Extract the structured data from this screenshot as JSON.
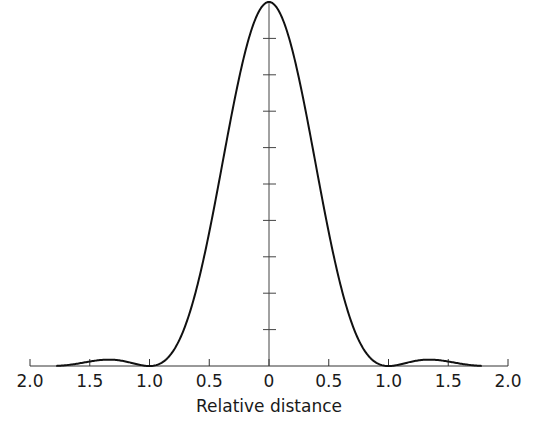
{
  "chart_data": {
    "type": "line",
    "title": "",
    "xlabel": "Relative distance",
    "ylabel": "",
    "x_tick_labels": [
      "2.0",
      "1.5",
      "1.0",
      "0.5",
      "0",
      "0.5",
      "1.0",
      "1.5",
      "2.0"
    ],
    "x_tick_values": [
      -2.0,
      -1.5,
      -1.0,
      -0.5,
      0,
      0.5,
      1.0,
      1.5,
      2.0
    ],
    "xlim": [
      -2.0,
      2.0
    ],
    "ylim": [
      0,
      1.0
    ],
    "y_ticks_count": 9,
    "y_tick_spacing": 0.1,
    "grid": false,
    "legend": null,
    "series": [
      {
        "name": "Relative intensity (Airy pattern)",
        "x": [
          -1.75,
          -1.5,
          -1.35,
          -1.2,
          -1.0,
          -0.9,
          -0.8,
          -0.7,
          -0.6,
          -0.5,
          -0.4,
          -0.3,
          -0.2,
          -0.1,
          0,
          0.1,
          0.2,
          0.3,
          0.4,
          0.5,
          0.6,
          0.7,
          0.8,
          0.9,
          1.0,
          1.2,
          1.35,
          1.5,
          1.75
        ],
        "y": [
          0.0,
          0.011,
          0.0175,
          0.01,
          0.0,
          0.02,
          0.07,
          0.16,
          0.29,
          0.44,
          0.6,
          0.75,
          0.88,
          0.97,
          1.0,
          0.97,
          0.88,
          0.75,
          0.6,
          0.44,
          0.29,
          0.16,
          0.07,
          0.02,
          0.0,
          0.01,
          0.0175,
          0.011,
          0.0
        ]
      }
    ]
  },
  "axis": {
    "labels": [
      "2.0",
      "1.5",
      "1.0",
      "0.5",
      "0",
      "0.5",
      "1.0",
      "1.5",
      "2.0"
    ],
    "title": "Relative distance"
  }
}
